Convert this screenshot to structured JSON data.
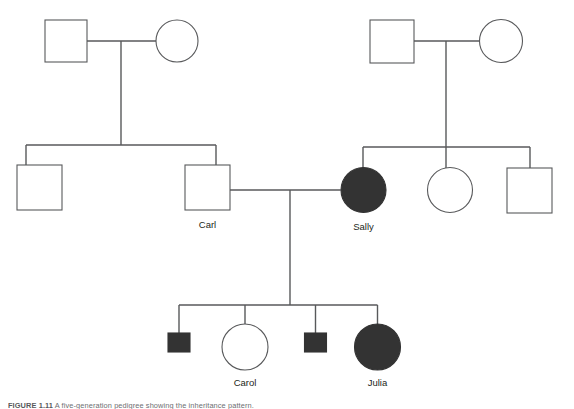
{
  "figure": {
    "caption_label": "FIGURE 1.11",
    "caption_text": "A five-generation pedigree showing the inheritance pattern."
  },
  "diagram": {
    "type": "pedigree",
    "colors": {
      "affected_fill": "#333333",
      "unaffected_fill": "#ffffff",
      "stroke": "#58595b",
      "label_text": "#231f20",
      "background": "#ffffff"
    },
    "legend_semantics": {
      "square": "male",
      "circle": "female",
      "filled": "affected",
      "unfilled": "unaffected",
      "small_square": "deceased-or-young-affected-male"
    },
    "generations": [
      {
        "id": "generation-1",
        "members": [
          {
            "id": "I-1",
            "shape": "square",
            "sex": "male",
            "affected": false,
            "label": "",
            "cx": 65.5,
            "cy": 41,
            "size": 42
          },
          {
            "id": "I-2",
            "shape": "circle",
            "sex": "female",
            "affected": false,
            "label": "",
            "cx": 177,
            "cy": 41,
            "size": 42
          },
          {
            "id": "I-3",
            "shape": "square",
            "sex": "male",
            "affected": false,
            "label": "",
            "cx": 392,
            "cy": 41,
            "size": 44
          },
          {
            "id": "I-4",
            "shape": "circle",
            "sex": "female",
            "affected": false,
            "label": "",
            "cx": 501,
            "cy": 41,
            "size": 43
          }
        ]
      },
      {
        "id": "generation-2",
        "members": [
          {
            "id": "II-1",
            "shape": "square",
            "sex": "male",
            "affected": false,
            "label": "",
            "cx": 39.5,
            "cy": 187.5,
            "size": 45
          },
          {
            "id": "II-2",
            "shape": "square",
            "sex": "male",
            "affected": false,
            "label": "Carl",
            "cx": 207.5,
            "cy": 187.5,
            "size": 45
          },
          {
            "id": "II-3",
            "shape": "circle",
            "sex": "female",
            "affected": true,
            "label": "Sally",
            "cx": 363.5,
            "cy": 190,
            "size": 45
          },
          {
            "id": "II-4",
            "shape": "circle",
            "sex": "female",
            "affected": false,
            "label": "",
            "cx": 450,
            "cy": 190,
            "size": 45
          },
          {
            "id": "II-5",
            "shape": "square",
            "sex": "male",
            "affected": false,
            "label": "",
            "cx": 529.5,
            "cy": 190,
            "size": 45
          }
        ]
      },
      {
        "id": "generation-3",
        "members": [
          {
            "id": "III-1",
            "shape": "square",
            "sex": "male",
            "affected": true,
            "label": "",
            "cx": 179,
            "cy": 343,
            "size": 22
          },
          {
            "id": "III-2",
            "shape": "circle",
            "sex": "female",
            "affected": false,
            "label": "Carol",
            "cx": 245,
            "cy": 347,
            "size": 46
          },
          {
            "id": "III-3",
            "shape": "square",
            "sex": "male",
            "affected": true,
            "label": "",
            "cx": 315.5,
            "cy": 343,
            "size": 22
          },
          {
            "id": "III-4",
            "shape": "circle",
            "sex": "female",
            "affected": true,
            "label": "Julia",
            "cx": 377.5,
            "cy": 347,
            "size": 46
          }
        ]
      }
    ],
    "matings": [
      {
        "id": "mating-1",
        "partners": [
          "I-1",
          "I-2"
        ],
        "line_y": 41,
        "drop_x": 121,
        "sibship_y": 145
      },
      {
        "id": "mating-2",
        "partners": [
          "I-3",
          "I-4"
        ],
        "line_y": 41,
        "drop_x": 446,
        "sibship_y": 147
      },
      {
        "id": "mating-3",
        "partners": [
          "II-2",
          "II-3"
        ],
        "line_y": 190,
        "drop_x": 290,
        "sibship_y": 305
      }
    ],
    "labels": {
      "carl": "Carl",
      "sally": "Sally",
      "carol": "Carol",
      "julia": "Julia"
    }
  }
}
